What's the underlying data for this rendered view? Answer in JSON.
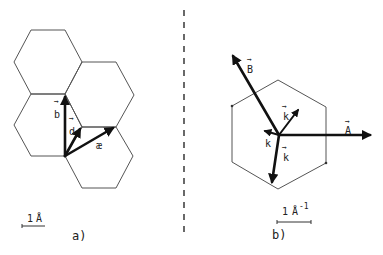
{
  "panel_a": {
    "caption": "a)",
    "vectors": {
      "b": "b",
      "d": "d",
      "x": "æ"
    },
    "arrow_mark": "→",
    "scale_bar": {
      "label_num": "1",
      "label_unit": "Å"
    }
  },
  "panel_b": {
    "caption": "b)",
    "vectors": {
      "A": "A",
      "B": "B",
      "k1": "k",
      "k2": "k",
      "k3": "k"
    },
    "arrow_mark": "→",
    "scale_bar": {
      "label_num": "1",
      "label_unit": "Å",
      "label_exp": "-1"
    }
  },
  "colors": {
    "lines": "#555555",
    "vectors": "#111111",
    "background": "#ffffff"
  }
}
